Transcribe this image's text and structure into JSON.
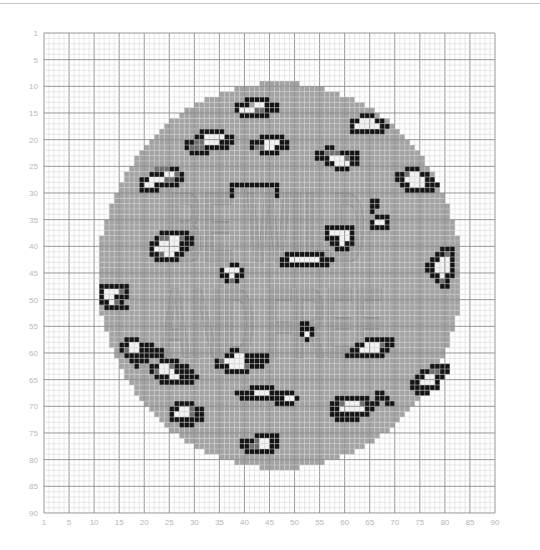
{
  "grid": {
    "cols": 90,
    "rows": 90,
    "origin_x": 44,
    "origin_y": 33,
    "cell_w": 5.011,
    "cell_h": 5.333
  },
  "colors": {
    "background": "#ffffff",
    "minor_line": "#d2d2d2",
    "major_line": "#8c8c8c",
    "fill": "#a3a3a3",
    "dark": "#6f6f6f",
    "black": "#141414",
    "white": "#f2f2f2",
    "text_outline": "#7d7d7d",
    "text_fill": "#979797",
    "label": "#b8b8b8"
  },
  "axis": {
    "x_ticks": [
      "1",
      "5",
      "10",
      "15",
      "20",
      "25",
      "30",
      "35",
      "40",
      "45",
      "50",
      "55",
      "60",
      "65",
      "70",
      "75",
      "80",
      "85",
      "90"
    ],
    "y_ticks": [
      "1",
      "5",
      "10",
      "15",
      "20",
      "25",
      "30",
      "35",
      "40",
      "45",
      "50",
      "55",
      "60",
      "65",
      "70",
      "75",
      "80",
      "85",
      "90"
    ]
  },
  "circle": {
    "center_col": 47.5,
    "center_row": 46,
    "radius": 36.2
  },
  "text_rows": {
    "line1": "BE WILD",
    "line2": "AND FREE",
    "line1_row": 30,
    "line1_col": 26,
    "line2_row": 48,
    "line2_col": 24,
    "letter_h": 14
  },
  "spots": [
    {
      "c": 39,
      "r": 13,
      "rows": [
        "..KKKKK..",
        "KKK.WWKKK",
        "KWWWDDKKK",
        ".KKKKKK.."
      ]
    },
    {
      "c": 62,
      "r": 16,
      "rows": [
        "..KKK...",
        "KKWWWKK.",
        "KWWWWWKK",
        "KKKKKKK."
      ]
    },
    {
      "c": 29,
      "r": 19,
      "rows": [
        "...KKKKK..",
        "..KKWWWWKK",
        "KKDDWWWKKK",
        "KDDDKKKKK.",
        ".KKKK....."
      ]
    },
    {
      "c": 20,
      "r": 26,
      "rows": [
        "...DDDKK",
        "..KKKWWDK",
        "KKWWWDDKK",
        "KWWKKKKK.",
        "KKKK....."
      ]
    },
    {
      "c": 42,
      "r": 20,
      "rows": [
        "..KKKKK..",
        "KKKWWWKK.",
        "KDDWWKKK.",
        "..KKKK..."
      ]
    },
    {
      "c": 55,
      "r": 22,
      "rows": [
        "..KK......",
        "KKDDDKKKK.",
        "KKKWWWDKK.",
        "..KKWWWKK.",
        "....KKK..."
      ]
    },
    {
      "c": 71,
      "r": 26,
      "rows": [
        "..KKK....",
        "KKDWWKK..",
        "KKWWWWKK.",
        ".KKWWWKKK",
        "..KKKKKK."
      ]
    },
    {
      "c": 38,
      "r": 29,
      "rows": [
        "KKKKKKKKKK",
        "K........K",
        "K........K"
      ]
    },
    {
      "c": 22,
      "r": 38,
      "rows": [
        "..KKKKKK..",
        ".KDDWWDKK.",
        "KKWWWWKKK.",
        "KWWWWWKK..",
        "KKDWWKK...",
        ".KKKKK...."
      ]
    },
    {
      "c": 12,
      "r": 48,
      "rows": [
        "KKKKKK.",
        "KWWWDK.",
        "KWWKKK.",
        "KKWDK..",
        ".KKKKK."
      ]
    },
    {
      "c": 36,
      "r": 44,
      "rows": [
        "..KK.",
        "KWWWK",
        "KKWKK",
        ".KDK."
      ]
    },
    {
      "c": 57,
      "r": 37,
      "rows": [
        "KKKKKK",
        "KWWWWK",
        "KKKWWK",
        ".KKWKK",
        "..KKK."
      ]
    },
    {
      "c": 48,
      "r": 42,
      "rows": [
        ".KKKKKKKK..",
        "KKWWWWWWKKK",
        "KKKKKKKKKK."
      ]
    },
    {
      "c": 66,
      "r": 32,
      "rows": [
        "KK.",
        "KK.",
        "K..",
        ".KKK",
        "KWWK",
        "KKKK"
      ]
    },
    {
      "c": 77,
      "r": 41,
      "rows": [
        "...KKK",
        "..KKDK",
        ".KKWWK",
        "KKWWWK",
        "KKWWWK",
        ".KKWKK",
        "..KDK.",
        "...KK."
      ]
    },
    {
      "c": 74,
      "r": 63,
      "rows": [
        "....KKKK",
        "..KKDDKK",
        ".KKWWKK.",
        "KKWWWK..",
        "KKKKKK..",
        ".KKK...."
      ]
    },
    {
      "c": 22,
      "r": 62,
      "rows": [
        "..KKKK....",
        "KKWWDKKK..",
        "KDWWWKKKK.",
        ".KKKWWKKKK",
        "..KKKKKKK."
      ]
    },
    {
      "c": 35,
      "r": 60,
      "rows": [
        "...KK.....",
        "..KKWWKKKKK",
        "KDWWWWKKKKK",
        "KKKWWWDKKK.",
        "..KKKKK...."
      ]
    },
    {
      "c": 16,
      "r": 58,
      "rows": [
        ".KKK.....",
        "KKWWKKK..",
        "KDWWKKKKK",
        ".KKKKKKKK",
        "..KKKK...",
        "...K....."
      ]
    },
    {
      "c": 52,
      "r": 55,
      "rows": [
        "KK.",
        "KKK",
        "KWK",
        ".K."
      ]
    },
    {
      "c": 61,
      "r": 58,
      "rows": [
        "....KKKKKK",
        "..KKWWWDKK",
        ".KKWWWWKK.",
        "KKKKKKKK.."
      ]
    },
    {
      "c": 39,
      "r": 67,
      "rows": [
        "...KKKKK...",
        "KKKKWWWKKKK",
        ".KKKKKKKKK."
      ]
    },
    {
      "c": 58,
      "r": 69,
      "rows": [
        ".KKKKKKK..",
        "KKDWWWDKKK",
        "KKWWWWWKK.",
        "KKKKKKKK..",
        ".KKKKK...."
      ]
    },
    {
      "c": 26,
      "r": 70,
      "rows": [
        ".KKKK...",
        "KKWWDKK.",
        "KWWWDKK.",
        "KKKKKKK.",
        "..KKK..."
      ]
    },
    {
      "c": 40,
      "r": 76,
      "rows": [
        "...KKKKK",
        "KKKDWWKK",
        "KKDDWWKK",
        ".KKKKKK."
      ]
    },
    {
      "c": 67,
      "r": 68,
      "rows": [
        "KK...",
        "KKK..",
        "..KK."
      ]
    },
    {
      "c": 47,
      "r": 68,
      "rows": [
        "..KK.",
        "KKWWK",
        "KKKK."
      ]
    }
  ]
}
